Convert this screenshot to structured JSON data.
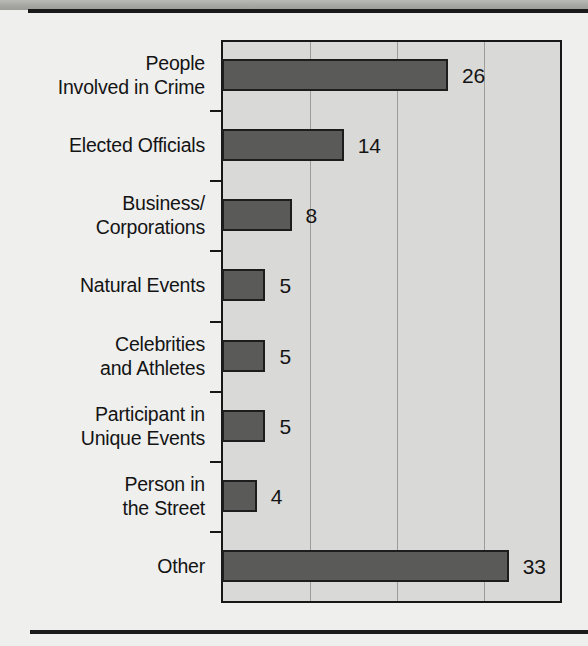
{
  "page": {
    "background_color": "#efefee",
    "rule_color": "#1a1a1a",
    "scan_band_label": "scan-edge-band"
  },
  "chart_data": {
    "type": "bar",
    "orientation": "horizontal",
    "title": "",
    "subtitle": "",
    "xlabel": "",
    "ylabel": "",
    "categories": [
      "People\nInvolved in Crime",
      "Elected Officials",
      "Business/\nCorporations",
      "Natural Events",
      "Celebrities\nand Athletes",
      "Participant in\nUnique Events",
      "Person in\nthe Street",
      "Other"
    ],
    "values": [
      26,
      14,
      8,
      5,
      5,
      5,
      4,
      33
    ],
    "value_labels": [
      "26",
      "14",
      "8",
      "5",
      "5",
      "5",
      "4",
      "33"
    ],
    "xlim": [
      0,
      39
    ],
    "grid": true,
    "gridline_values": [
      10,
      20,
      30
    ],
    "legend": null,
    "bar_color": "#5a5a58",
    "bar_border_color": "#1d1d1d",
    "plot_background": "#d9d9d7",
    "axis_color": "#171717",
    "gridline_color": "#9c9c99",
    "label_color": "#141414"
  }
}
